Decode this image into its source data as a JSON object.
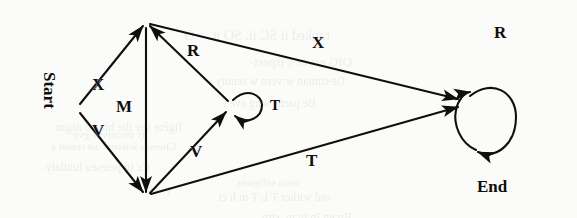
{
  "figure": {
    "type": "state-transition-diagram",
    "background_color": "#fbfbfa",
    "ink_color": "#100f0d"
  },
  "nodes": [
    {
      "id": "start",
      "label": "Start",
      "x": 78,
      "y": 108,
      "label_x": 52,
      "label_y": 78,
      "rotated": true
    },
    {
      "id": "top",
      "label": "",
      "x": 146,
      "y": 23
    },
    {
      "id": "bottom",
      "label": "",
      "x": 146,
      "y": 196
    },
    {
      "id": "middle",
      "label": "",
      "x": 232,
      "y": 105
    },
    {
      "id": "end",
      "label": "End",
      "x": 463,
      "y": 103,
      "label_x": 489,
      "label_y": 187
    }
  ],
  "edges": [
    {
      "id": "e-x-up",
      "label": "X",
      "from": "start",
      "to": "top",
      "label_x": 97,
      "label_y": 84
    },
    {
      "id": "e-v-down",
      "label": "V",
      "from": "start",
      "to": "bottom",
      "label_x": 97,
      "label_y": 129
    },
    {
      "id": "e-m",
      "label": "M",
      "from": "top",
      "to": "bottom",
      "label_x": 123,
      "label_y": 105
    },
    {
      "id": "e-r-up",
      "label": "R",
      "from": "middle",
      "to": "top",
      "label_x": 192,
      "label_y": 50
    },
    {
      "id": "e-v-up",
      "label": "V",
      "from": "bottom",
      "to": "middle",
      "label_x": 195,
      "label_y": 150
    },
    {
      "id": "e-x-long",
      "label": "X",
      "from": "top",
      "to": "end",
      "label_x": 317,
      "label_y": 42
    },
    {
      "id": "e-t-long",
      "label": "T",
      "from": "bottom",
      "to": "end",
      "label_x": 311,
      "label_y": 160
    }
  ],
  "self_loops": [
    {
      "id": "loop-t",
      "label": "T",
      "on": "middle",
      "label_x": 262,
      "label_y": 99
    },
    {
      "id": "loop-r",
      "label": "R",
      "on": "end",
      "label_x": 504,
      "label_y": 31
    }
  ],
  "bleed_through_text": [
    {
      "text": "ranked it SC it. SO it. = O",
      "x": 330,
      "y": 28,
      "size": 14
    },
    {
      "text": "OIG eevee-r ispect-",
      "x": 352,
      "y": 54,
      "size": 13
    },
    {
      "text": "Gr-rtiman w:vern w renuty",
      "x": 345,
      "y": 74,
      "size": 12
    },
    {
      "text": "Be partis wng ave i",
      "x": 316,
      "y": 96,
      "size": 12
    },
    {
      "text": "figére say the blue 0 nigan",
      "x": 182,
      "y": 120,
      "size": 12
    },
    {
      "text": "Cheeses ieleennt ast reeset a",
      "x": 176,
      "y": 140,
      "size": 11
    },
    {
      "text": "iiy permivne gve",
      "x": 148,
      "y": 128,
      "size": 11
    },
    {
      "text": "Cc tg peieseu lunilaly.",
      "x": 150,
      "y": 160,
      "size": 12
    },
    {
      "text": "p-n h-p",
      "x": 170,
      "y": 182,
      "size": 11
    },
    {
      "text": "ard wither T L T m h ci",
      "x": 330,
      "y": 190,
      "size": 12
    },
    {
      "text": "Brcen In ty m. strn.",
      "x": 352,
      "y": 210,
      "size": 12
    },
    {
      "text": "wera sefigares",
      "x": 300,
      "y": 176,
      "size": 11
    }
  ],
  "styles": {
    "edge_label_size": "17px",
    "node_label_size": "17px",
    "stroke_width": 2.1
  }
}
